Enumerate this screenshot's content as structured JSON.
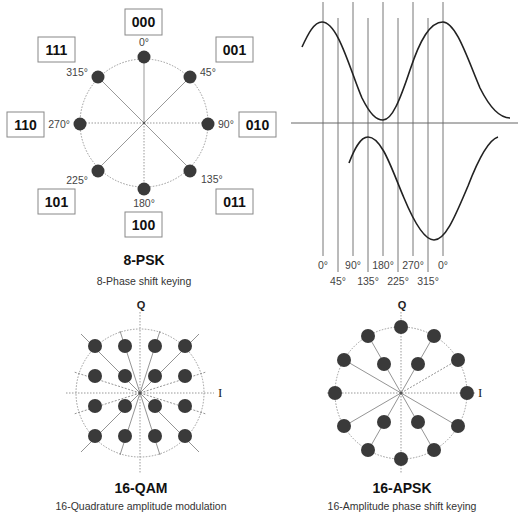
{
  "psk8": {
    "title": "8-PSK",
    "subtitle": "8-Phase shift keying",
    "points": [
      {
        "angle": "0°",
        "bits": "000"
      },
      {
        "angle": "45°",
        "bits": "001"
      },
      {
        "angle": "90°",
        "bits": "010"
      },
      {
        "angle": "135°",
        "bits": "011"
      },
      {
        "angle": "180°",
        "bits": "100"
      },
      {
        "angle": "225°",
        "bits": "101"
      },
      {
        "angle": "270°",
        "bits": "110"
      },
      {
        "angle": "315°",
        "bits": "111"
      }
    ]
  },
  "waveform": {
    "phase_labels_top": [
      "0°",
      "90°",
      "180°",
      "270°",
      "0°"
    ],
    "phase_labels_bottom": [
      "45°",
      "135°",
      "225°",
      "315°"
    ]
  },
  "qam16": {
    "title": "16-QAM",
    "subtitle": "16-Quadrature amplitude modulation",
    "axis_q": "Q",
    "axis_i": "I"
  },
  "apsk16": {
    "title": "16-APSK",
    "subtitle": "16-Amplitude phase shift keying",
    "axis_q": "Q",
    "axis_i": "I"
  },
  "colors": {
    "dot": "#3a3a3a",
    "line": "#8a8a8a",
    "curve": "#222222",
    "box_border": "#888888"
  }
}
